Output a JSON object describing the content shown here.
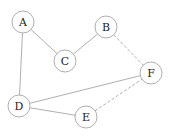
{
  "diagram": {
    "type": "undirected-graph",
    "node_radius": 11,
    "colors": {
      "stroke": "#9a9a9a",
      "label": "#222222",
      "background": "#ffffff"
    },
    "nodes": [
      {
        "id": "A",
        "label": "A",
        "x": 23,
        "y": 22
      },
      {
        "id": "B",
        "label": "B",
        "x": 106,
        "y": 27
      },
      {
        "id": "C",
        "label": "C",
        "x": 65,
        "y": 61
      },
      {
        "id": "F",
        "label": "F",
        "x": 151,
        "y": 73
      },
      {
        "id": "D",
        "label": "D",
        "x": 19,
        "y": 106
      },
      {
        "id": "E",
        "label": "E",
        "x": 86,
        "y": 117
      }
    ],
    "edges": [
      {
        "from": "A",
        "to": "C",
        "style": "solid"
      },
      {
        "from": "A",
        "to": "D",
        "style": "solid"
      },
      {
        "from": "B",
        "to": "C",
        "style": "solid"
      },
      {
        "from": "B",
        "to": "F",
        "style": "dashed"
      },
      {
        "from": "D",
        "to": "F",
        "style": "solid"
      },
      {
        "from": "D",
        "to": "E",
        "style": "solid"
      },
      {
        "from": "E",
        "to": "F",
        "style": "dashed"
      }
    ]
  }
}
